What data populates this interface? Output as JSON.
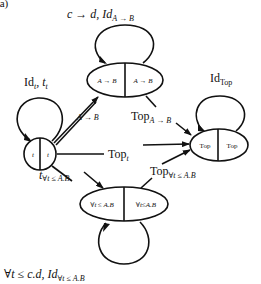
{
  "figure_label": "(a)",
  "nodes": {
    "left": {
      "left": "t",
      "right": "t"
    },
    "top": {
      "left": "A → B",
      "right": "A → B"
    },
    "right": {
      "left": "Top",
      "right": "Top"
    },
    "bottom": {
      "left": "∀t ≤ A.B",
      "right": "∀t≤A.B"
    }
  },
  "loops": {
    "left": {
      "main": "Id",
      "sub": "t",
      "tail": ", t",
      "tail_sub": "t"
    },
    "top": {
      "main": "c → d, Id",
      "sub": "A → B"
    },
    "right": {
      "main": "Id",
      "sub": "Top"
    },
    "bottom": {
      "main": "∀t ≤ c.d, Id",
      "sub": "∀t ≤ A.B"
    }
  },
  "edges": {
    "left_to_top": "A → B",
    "left_to_right": {
      "main": "Top",
      "sub": "t"
    },
    "left_to_bottom": {
      "main": "t",
      "sub": "∀t ≤ A.B"
    },
    "top_to_right": {
      "main": "Top",
      "sub": "A → B"
    },
    "bottom_to_right": {
      "main": "Top",
      "sub": "∀t ≤ A.B"
    }
  }
}
